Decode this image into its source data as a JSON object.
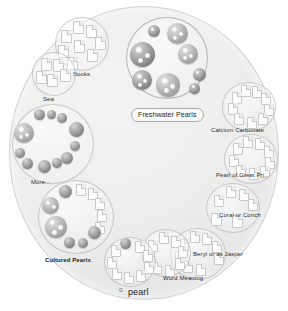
{
  "view": {
    "query_term": "pearl",
    "query_prefix": "G",
    "background_color": "#ffffff",
    "disc_color": "#ededed",
    "pearl_color": "#8f8f8f",
    "document_color": "#fdfdfd"
  },
  "clusters": [
    {
      "id": "books",
      "label": "Books",
      "node_type": "document",
      "node_count": 9
    },
    {
      "id": "sea",
      "label": "Sea",
      "node_type": "document",
      "node_count": 5
    },
    {
      "id": "freshwater-pearls",
      "label": "Freshwater Pearls",
      "node_type": "pearl",
      "node_count": 8,
      "selected": true
    },
    {
      "id": "more",
      "label": "More...",
      "node_type": "pearl",
      "node_count": 11
    },
    {
      "id": "cultured-pearls",
      "label": "Cultured Pearls",
      "node_type": "mixed",
      "node_count": 12
    },
    {
      "id": "calcium-carbonate",
      "label": "Calcium Carbonate",
      "node_type": "document",
      "node_count": 9
    },
    {
      "id": "pearl-of-great-price",
      "label": "Pearl of Great Pri...",
      "node_type": "document",
      "node_count": 9
    },
    {
      "id": "coral-or-conch",
      "label": "Coral or Conch",
      "node_type": "document",
      "node_count": 6
    },
    {
      "id": "beryl-or-as-jasper",
      "label": "Beryl or as Jasper",
      "node_type": "document",
      "node_count": 8
    },
    {
      "id": "word-meaning",
      "label": "Word Meaning",
      "node_type": "document",
      "node_count": 8
    },
    {
      "id": "g-pearl",
      "label": "pearl",
      "node_type": "mixed",
      "node_count": 10
    }
  ]
}
